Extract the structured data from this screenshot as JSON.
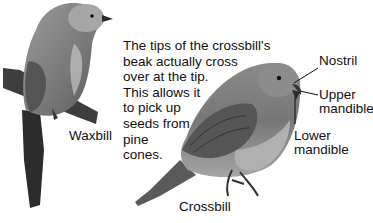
{
  "description_lines": [
    "The tips of the crossbill's",
    "beak actually cross",
    "over at the tip.",
    "This allows it",
    "to pick up",
    "seeds from",
    "pine",
    "cones."
  ],
  "labels": {
    "waxbill": "Waxbill",
    "crossbill": "Crossbill",
    "nostril": "Nostril",
    "upper_mandible": [
      "Upper",
      "mandible"
    ],
    "lower_mandible": [
      "Lower",
      "mandible"
    ]
  }
}
